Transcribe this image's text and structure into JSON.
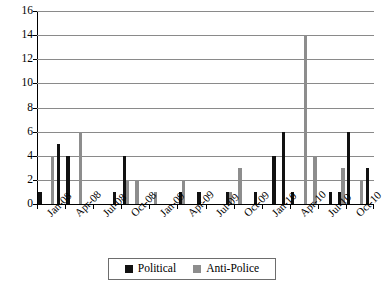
{
  "chart_data": {
    "type": "bar",
    "title": "",
    "subtitle": "",
    "xlabel": "",
    "ylabel": "",
    "ylim": [
      0,
      16
    ],
    "ytick_values": [
      0,
      2,
      4,
      6,
      8,
      10,
      12,
      14,
      16
    ],
    "ytick_labels": [
      "0",
      "2",
      "4",
      "6",
      "8",
      "10",
      "12",
      "14",
      "16"
    ],
    "grid": true,
    "grid_axis": "y",
    "legend_position": "bottom-center",
    "xtick_labels": [
      "Jan-08",
      "Apr-08",
      "Jul-08",
      "Oct-08",
      "Jan-09",
      "Apr-09",
      "Jul-09",
      "Oct-09",
      "Jan-10",
      "Apr-10",
      "Jul-10",
      "Oct-10"
    ],
    "categories": [
      "Jan-08",
      "Feb-08",
      "Mar-08",
      "Apr-08",
      "May-08",
      "Jun-08",
      "Jul-08",
      "Aug-08",
      "Sep-08",
      "Oct-08",
      "Nov-08",
      "Dec-08",
      "Jan-09",
      "Feb-09",
      "Mar-09",
      "Apr-09",
      "May-09",
      "Jun-09",
      "Jul-09",
      "Aug-09",
      "Sep-09",
      "Oct-09",
      "Nov-09",
      "Dec-09",
      "Jan-10",
      "Feb-10",
      "Mar-10",
      "Apr-10",
      "May-10",
      "Jun-10",
      "Jul-10",
      "Aug-10",
      "Sep-10",
      "Oct-10",
      "Nov-10",
      "Dec-10"
    ],
    "series": [
      {
        "name": "Political",
        "color": "#111111",
        "values": [
          1,
          0,
          5,
          4,
          0,
          0,
          0,
          0,
          1,
          4,
          0,
          0,
          0,
          0,
          0,
          1,
          0,
          1,
          0,
          0,
          1,
          0,
          0,
          1,
          0,
          4,
          6,
          1,
          0,
          0,
          0,
          1,
          1,
          6,
          0,
          3
        ]
      },
      {
        "name": "Anti-Police",
        "color": "#8d8d8d",
        "values": [
          0,
          4,
          0,
          0,
          6,
          0,
          0,
          0,
          0,
          2,
          2,
          0,
          1,
          0,
          0,
          2,
          0,
          0,
          0,
          0,
          1,
          3,
          0,
          0,
          0,
          0,
          0,
          0,
          14,
          4,
          0,
          0,
          3,
          0,
          2,
          0
        ]
      }
    ]
  },
  "legend": {
    "items": [
      {
        "label": "Political",
        "color": "#111111"
      },
      {
        "label": "Anti-Police",
        "color": "#8d8d8d"
      }
    ]
  },
  "colors": {
    "political": "#111111",
    "antipolice": "#8d8d8d",
    "gridline": "#8a8a8a",
    "axis": "#000000",
    "background": "#ffffff"
  }
}
